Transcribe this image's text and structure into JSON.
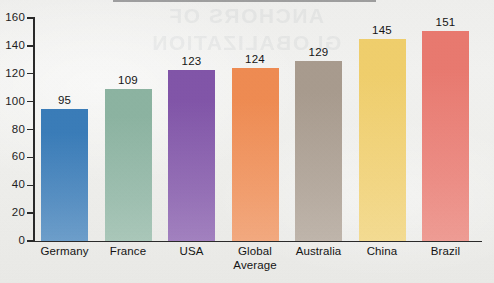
{
  "chart_data": {
    "type": "bar",
    "title": "",
    "xlabel": "",
    "ylabel": "",
    "ylim": [
      0,
      160
    ],
    "ytick_step": 20,
    "yticks": [
      "0",
      "20",
      "40",
      "60",
      "80",
      "100",
      "120",
      "140",
      "160"
    ],
    "grid": false,
    "legend": false,
    "categories": [
      "Germany",
      "France",
      "USA",
      "Global Average",
      "Australia",
      "China",
      "Brazil"
    ],
    "values": [
      95,
      109,
      123,
      124,
      129,
      145,
      151
    ],
    "bar_labels": [
      "95",
      "109",
      "123",
      "124",
      "129",
      "145",
      "151"
    ],
    "bar_colors": [
      "#3a7cb8",
      "#8cb3a1",
      "#8155a8",
      "#ee8b52",
      "#a89b8e",
      "#efce6c",
      "#e8796f"
    ]
  },
  "categories_display": [
    {
      "line1": "Germany",
      "line2": ""
    },
    {
      "line1": "France",
      "line2": ""
    },
    {
      "line1": "USA",
      "line2": ""
    },
    {
      "line1": "Global",
      "line2": "Average"
    },
    {
      "line1": "Australia",
      "line2": ""
    },
    {
      "line1": "China",
      "line2": ""
    },
    {
      "line1": "Brazil",
      "line2": ""
    }
  ],
  "page": {
    "background_color": "#efefed",
    "axis_color": "#2a2a2a",
    "text_color": "#141414",
    "showthrough_text_line1": "ANCHORS OF",
    "showthrough_text_line2": "GLOBALIZATION"
  }
}
